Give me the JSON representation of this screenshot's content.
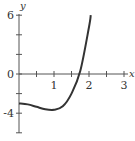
{
  "chart_data": {
    "type": "line",
    "title": "",
    "xlabel": "x",
    "ylabel": "y",
    "xlim": [
      0,
      3
    ],
    "ylim": [
      -6,
      6
    ],
    "x_ticks": [
      0.5,
      1,
      1.5,
      2,
      2.5,
      3
    ],
    "x_tick_labels": [
      "1",
      "2",
      "3"
    ],
    "y_ticks": [
      6,
      4,
      2,
      0,
      -2,
      -4,
      -6
    ],
    "y_tick_labels": [
      "6",
      "0",
      "-4"
    ],
    "grid": false,
    "legend": null,
    "series": [
      {
        "name": "curve",
        "x": [
          0,
          0.25,
          0.5,
          0.75,
          1.0,
          1.25,
          1.5,
          1.75,
          2.0,
          2.05
        ],
        "y": [
          -3.0,
          -3.1,
          -3.35,
          -3.6,
          -3.65,
          -3.3,
          -2.0,
          0.3,
          4.8,
          6.0
        ]
      }
    ],
    "colors": {
      "curve": "#333333",
      "axis": "#555555"
    }
  }
}
